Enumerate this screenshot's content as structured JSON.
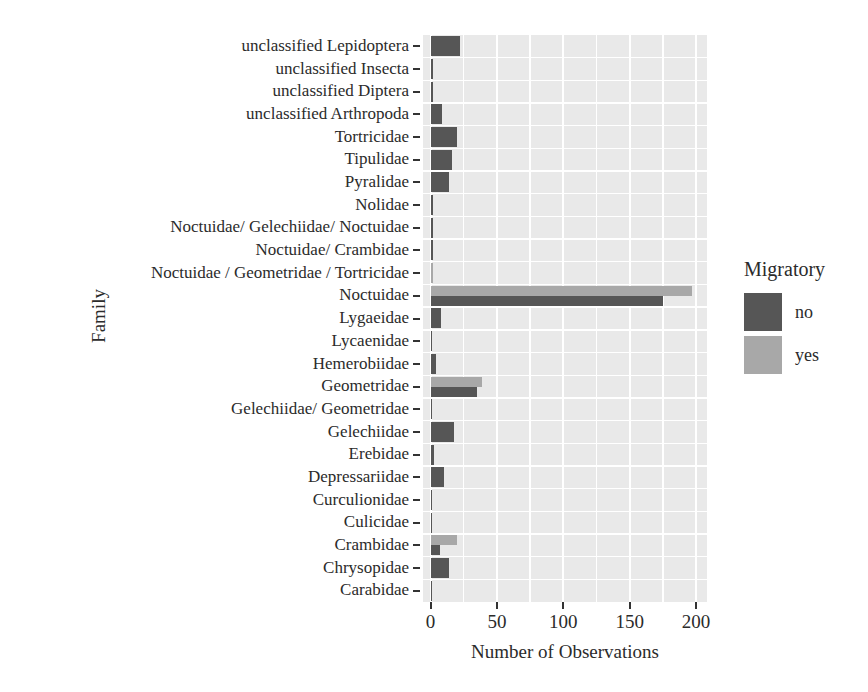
{
  "chart_data": {
    "type": "bar",
    "orientation": "horizontal",
    "title": "",
    "xlabel": "Number of Observations",
    "ylabel": "Family",
    "xlim": [
      0,
      210
    ],
    "x_ticks": [
      0,
      50,
      100,
      150,
      200
    ],
    "x_minor_step": 25,
    "grid": true,
    "panel_bg": "#e9e9e9",
    "grid_color": "#ffffff",
    "tick_color": "#333333",
    "text_color": "#2b2b2b",
    "legend": {
      "title": "Migratory",
      "position": "right",
      "entries": [
        {
          "label": "no",
          "color": "#565656"
        },
        {
          "label": "yes",
          "color": "#a8a8a8"
        }
      ]
    },
    "categories": [
      "unclassified Lepidoptera",
      "unclassified Insecta",
      "unclassified Diptera",
      "unclassified Arthropoda",
      "Tortricidae",
      "Tipulidae",
      "Pyralidae",
      "Nolidae",
      "Noctuidae/ Gelechiidae/ Noctuidae",
      "Noctuidae/ Crambidae",
      "Noctuidae / Geometridae / Tortricidae",
      "Noctuidae",
      "Lygaeidae",
      "Lycaenidae",
      "Hemerobiidae",
      "Geometridae",
      "Gelechiidae/ Geometridae",
      "Gelechiidae",
      "Erebidae",
      "Depressariidae",
      "Curculionidae",
      "Culicidae",
      "Crambidae",
      "Chrysopidae",
      "Carabidae"
    ],
    "series": [
      {
        "name": "yes",
        "color": "#a8a8a8",
        "values": [
          null,
          null,
          null,
          null,
          null,
          null,
          null,
          null,
          null,
          null,
          2,
          197,
          null,
          null,
          null,
          39,
          null,
          null,
          null,
          null,
          null,
          null,
          20,
          null,
          null
        ]
      },
      {
        "name": "no",
        "color": "#565656",
        "values": [
          22,
          2,
          2,
          9,
          20,
          16,
          14,
          2,
          2,
          2,
          null,
          175,
          8,
          1,
          4,
          35,
          1,
          18,
          3,
          10,
          1,
          1,
          7,
          14,
          1
        ]
      }
    ]
  }
}
